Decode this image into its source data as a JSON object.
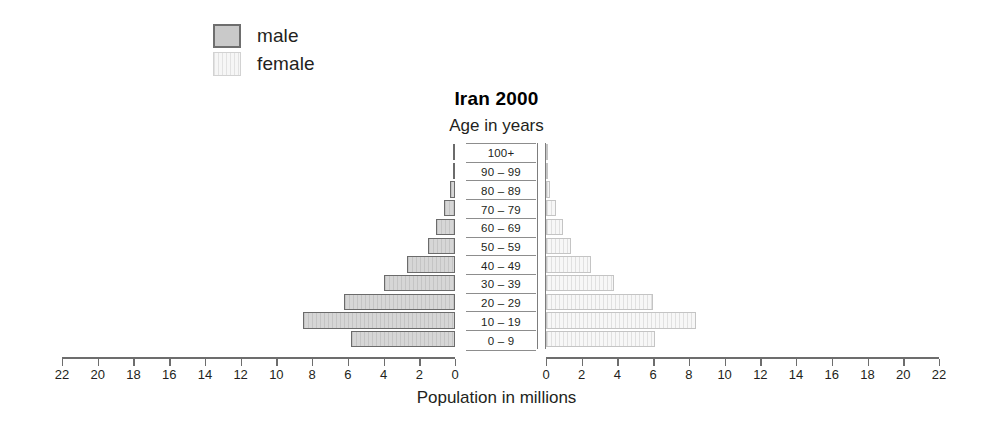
{
  "legend": {
    "items": [
      {
        "key": "male",
        "label": "male",
        "color": "#c9c9c9"
      },
      {
        "key": "female",
        "label": "female",
        "color": "#efefef"
      }
    ]
  },
  "title": "Iran 2000",
  "subtitle": "Age in years",
  "axis_title": "Population in millions",
  "chart_data": {
    "type": "bar",
    "subtype": "population-pyramid",
    "title": "Iran 2000",
    "subtitle": "Age in years",
    "xlabel": "Population in millions",
    "ylabel": "Age in years",
    "orientation": "horizontal",
    "grid": false,
    "legend_position": "top-left",
    "xlim": [
      0,
      22
    ],
    "xticks": [
      22,
      20,
      18,
      16,
      14,
      12,
      10,
      8,
      6,
      4,
      2,
      0,
      0,
      2,
      4,
      6,
      8,
      10,
      12,
      14,
      16,
      18,
      20,
      22
    ],
    "xticks_left": [
      22,
      20,
      18,
      16,
      14,
      12,
      10,
      8,
      6,
      4,
      2,
      0
    ],
    "xticks_right": [
      0,
      2,
      4,
      6,
      8,
      10,
      12,
      14,
      16,
      18,
      20,
      22
    ],
    "categories": [
      "100+",
      "90 – 99",
      "80 – 89",
      "70 – 79",
      "60 – 69",
      "50 – 59",
      "40 – 49",
      "30 – 39",
      "20 – 29",
      "10 – 19",
      "0 – 9"
    ],
    "series": [
      {
        "name": "male",
        "values": [
          0.02,
          0.08,
          0.28,
          0.62,
          1.05,
          1.5,
          2.7,
          4.0,
          6.2,
          8.5,
          5.8
        ]
      },
      {
        "name": "female",
        "values": [
          0.02,
          0.07,
          0.25,
          0.55,
          0.95,
          1.4,
          2.5,
          3.8,
          6.0,
          8.4,
          6.1
        ]
      }
    ]
  }
}
